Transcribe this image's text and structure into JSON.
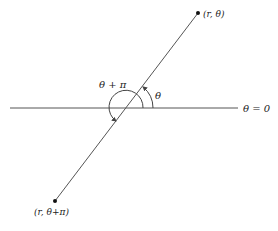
{
  "diagram": {
    "type": "polar-coordinates-illustration",
    "colors": {
      "line": "#555555",
      "text": "#222222",
      "background": "#ffffff"
    },
    "polar_axis": {
      "label": "θ = 0"
    },
    "points": [
      {
        "id": "p1",
        "label": "(r, θ)"
      },
      {
        "id": "p2",
        "label": "(r, θ+π)"
      }
    ],
    "angles": [
      {
        "id": "theta",
        "label": "θ"
      },
      {
        "id": "theta-plus-pi",
        "label": "θ + π"
      }
    ]
  }
}
